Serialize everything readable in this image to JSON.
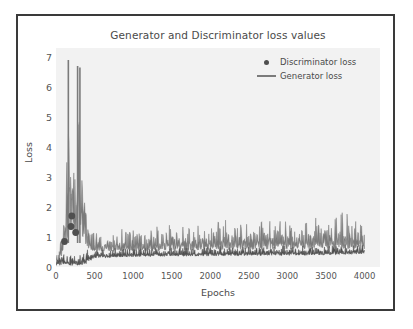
{
  "chart_data": {
    "type": "line",
    "title": "Generator and Discriminator loss values",
    "xlabel": "Epochs",
    "ylabel": "Loss",
    "xlim": [
      0,
      4200
    ],
    "ylim": [
      0,
      7.3
    ],
    "xticks": [
      0,
      500,
      1000,
      1500,
      2000,
      2500,
      3000,
      3500,
      4000
    ],
    "xtick_labels": [
      "0",
      "500",
      "1000",
      "1500",
      "2000",
      "2500",
      "3000",
      "3500",
      "4000"
    ],
    "yticks": [
      0,
      1,
      2,
      3,
      4,
      5,
      6,
      7
    ],
    "ytick_labels": [
      "0",
      "1",
      "2",
      "3",
      "4",
      "5",
      "6",
      "7"
    ],
    "grid": false,
    "legend_position": "upper right",
    "plot_background": "#f2f2f2",
    "series": [
      {
        "name": "Discriminator loss",
        "marker": "dot",
        "color": "#4f4f4f",
        "style": "noise-band",
        "description": "Low dark band near 0.1-0.7 rising slightly after epoch 500; isolated dot markers near epochs 110, 190 and 250 at losses 0.85, 1.35 and 1.70",
        "band_points": [
          {
            "x": 0,
            "lo": 0.05,
            "hi": 0.55
          },
          {
            "x": 60,
            "lo": 0.05,
            "hi": 0.7
          },
          {
            "x": 120,
            "lo": 0.08,
            "hi": 0.45
          },
          {
            "x": 200,
            "lo": 0.05,
            "hi": 0.4
          },
          {
            "x": 300,
            "lo": 0.05,
            "hi": 0.55
          },
          {
            "x": 400,
            "lo": 0.1,
            "hi": 0.6
          },
          {
            "x": 500,
            "lo": 0.3,
            "hi": 0.62
          },
          {
            "x": 1000,
            "lo": 0.34,
            "hi": 0.66
          },
          {
            "x": 1500,
            "lo": 0.35,
            "hi": 0.68
          },
          {
            "x": 2000,
            "lo": 0.36,
            "hi": 0.7
          },
          {
            "x": 2500,
            "lo": 0.38,
            "hi": 0.72
          },
          {
            "x": 3000,
            "lo": 0.38,
            "hi": 0.74
          },
          {
            "x": 3500,
            "lo": 0.4,
            "hi": 0.76
          },
          {
            "x": 4000,
            "lo": 0.42,
            "hi": 0.8
          }
        ],
        "markers": [
          {
            "x": 110,
            "y": 0.85
          },
          {
            "x": 195,
            "y": 1.35
          },
          {
            "x": 205,
            "y": 1.7
          },
          {
            "x": 255,
            "y": 1.15
          }
        ]
      },
      {
        "name": "Generator loss",
        "marker": "line",
        "color": "#7b7b7b",
        "style": "noise-band",
        "description": "Starts near 0.3, climbs steeply to two tall spikes of 6.9 and 6.7 between epochs 150 and 330, collapses after epoch 450 and settles into a noisy band between 0.5 and 1.7 for the rest of training",
        "band_points": [
          {
            "x": 0,
            "lo": 0.2,
            "hi": 0.45
          },
          {
            "x": 40,
            "lo": 0.15,
            "hi": 0.6
          },
          {
            "x": 90,
            "lo": 0.4,
            "hi": 2.6
          },
          {
            "x": 130,
            "lo": 0.6,
            "hi": 4.3
          },
          {
            "x": 160,
            "lo": 1.0,
            "hi": 6.9
          },
          {
            "x": 190,
            "lo": 1.2,
            "hi": 5.6
          },
          {
            "x": 220,
            "lo": 1.0,
            "hi": 5.7
          },
          {
            "x": 250,
            "lo": 0.9,
            "hi": 4.1
          },
          {
            "x": 280,
            "lo": 1.0,
            "hi": 6.7
          },
          {
            "x": 310,
            "lo": 1.1,
            "hi": 6.7
          },
          {
            "x": 340,
            "lo": 0.9,
            "hi": 4.6
          },
          {
            "x": 380,
            "lo": 0.7,
            "hi": 2.3
          },
          {
            "x": 430,
            "lo": 0.6,
            "hi": 1.6
          },
          {
            "x": 500,
            "lo": 0.5,
            "hi": 1.2
          },
          {
            "x": 800,
            "lo": 0.52,
            "hi": 1.25
          },
          {
            "x": 1200,
            "lo": 0.52,
            "hi": 1.4
          },
          {
            "x": 1600,
            "lo": 0.55,
            "hi": 1.45
          },
          {
            "x": 2000,
            "lo": 0.55,
            "hi": 1.55
          },
          {
            "x": 2400,
            "lo": 0.58,
            "hi": 1.6
          },
          {
            "x": 2800,
            "lo": 0.58,
            "hi": 1.7
          },
          {
            "x": 3200,
            "lo": 0.6,
            "hi": 1.55
          },
          {
            "x": 3700,
            "lo": 0.6,
            "hi": 2.0
          },
          {
            "x": 4000,
            "lo": 0.6,
            "hi": 1.45
          }
        ],
        "peaks": [
          {
            "x": 160,
            "y": 6.9
          },
          {
            "x": 280,
            "y": 6.7
          },
          {
            "x": 310,
            "y": 6.65
          },
          {
            "x": 3700,
            "y": 2.0
          }
        ]
      }
    ]
  },
  "legend": {
    "entries": [
      {
        "label": "Discriminator loss",
        "marker": "dot"
      },
      {
        "label": "Generator loss",
        "marker": "line"
      }
    ]
  }
}
